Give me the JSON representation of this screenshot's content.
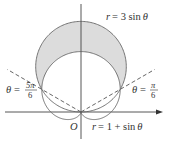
{
  "diagram": {
    "type": "polar-region",
    "curves": [
      {
        "name": "circle",
        "label": "r = 3 sin θ",
        "equation": "r = 3 sin θ",
        "coefficient": 3
      },
      {
        "name": "cardioid",
        "label": "r = 1 + sin θ",
        "equation": "r = 1 + sin θ"
      }
    ],
    "rays": [
      {
        "name": "ray-pi-6",
        "label_lhs": "θ =",
        "label_num": "π",
        "label_den": "6",
        "angle_fraction_of_pi": 0.16667
      },
      {
        "name": "ray-5pi-6",
        "label_lhs": "θ =",
        "label_num": "5π",
        "label_den": "6",
        "angle_fraction_of_pi": 0.83333
      }
    ],
    "origin_label": "O",
    "shaded_region": "inside r = 3 sin θ and outside r = 1 + sin θ, between θ = π/6 and θ = 5π/6",
    "colors": {
      "shade": "#dcdcdc",
      "stroke": "#555555",
      "axis": "#444444"
    }
  },
  "labels": {
    "circle_r": "r",
    "circle_rhs": "= 3 sin",
    "circle_theta": "θ",
    "cardioid_r": "r",
    "cardioid_rhs": "= 1 + sin",
    "cardioid_theta": "θ",
    "left_theta": "θ",
    "left_eq": "=",
    "left_num": "5π",
    "left_den": "6",
    "right_theta": "θ",
    "right_eq": "=",
    "right_num": "π",
    "right_den": "6",
    "origin": "O"
  }
}
